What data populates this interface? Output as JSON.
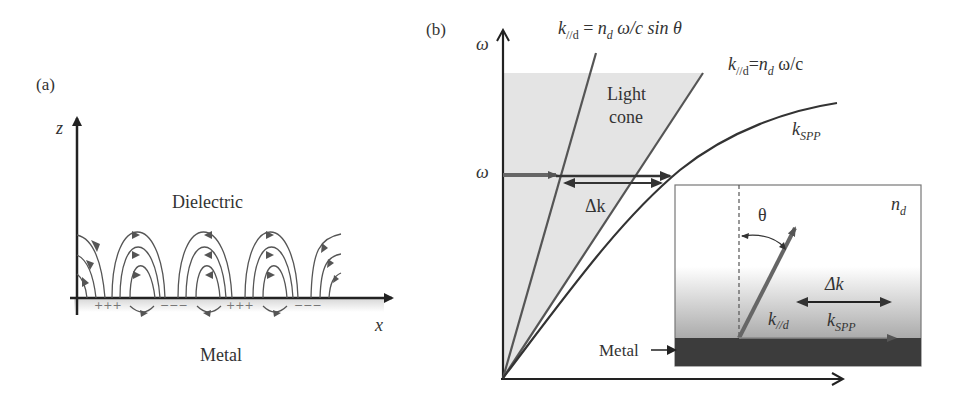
{
  "panel_a": {
    "label": "(a)",
    "axis_z": "z",
    "axis_x": "x",
    "region_top": "Dielectric",
    "region_bottom": "Metal",
    "charges": [
      "+++",
      "−−−",
      "+++",
      "−−−"
    ]
  },
  "panel_b": {
    "label": "(b)",
    "axis_y": "ω",
    "omega_marker": "ω",
    "light_cone_line1": "Light",
    "light_cone_line2": "cone",
    "eq_steep_k": "k",
    "eq_steep_sub": "//d",
    "eq_steep_rest": " = ",
    "eq_steep_n": "n",
    "eq_steep_nsub": "d",
    "eq_steep_tail": " ω/c sin θ",
    "eq_light_k": "k",
    "eq_light_sub": "//d",
    "eq_light_eq": "=",
    "eq_light_n": "n",
    "eq_light_nsub": "d",
    "eq_light_tail": " ω/c",
    "kspp_k": "k",
    "kspp_sub": "SPP",
    "delta_k": "Δk",
    "inset": {
      "n_label": "n",
      "n_sub": "d",
      "theta": "θ",
      "delta_k": "Δk",
      "k_par": "k",
      "k_par_sub": "//d",
      "k_spp": "k",
      "k_spp_sub": "SPP",
      "metal_label": "Metal"
    }
  }
}
